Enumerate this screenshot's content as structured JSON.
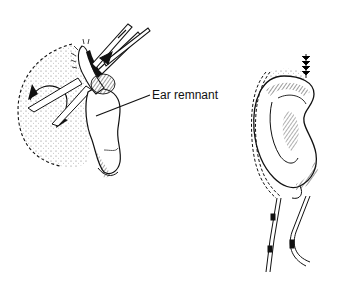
{
  "figure": {
    "left_panel": {
      "description": "Ear remnant with forceps and rotating skin flap",
      "label": "Ear remnant"
    },
    "right_panel": {
      "description": "Reconstructed ear with suture and drains"
    }
  },
  "colors": {
    "ink": "#111111",
    "stipple": "#555555",
    "background": "#ffffff"
  }
}
